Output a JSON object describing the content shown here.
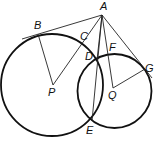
{
  "diagram": {
    "type": "geometry",
    "colors": {
      "stroke": "#111111",
      "background": "#ffffff"
    },
    "points": {
      "A": {
        "label": "A",
        "x": 102,
        "y": 15
      },
      "B": {
        "label": "B",
        "x": 38,
        "y": 34
      },
      "C": {
        "label": "C",
        "x": 87,
        "y": 41
      },
      "D": {
        "label": "D",
        "x": 97,
        "y": 60
      },
      "E": {
        "label": "E",
        "x": 92,
        "y": 121
      },
      "F": {
        "label": "F",
        "x": 108,
        "y": 55
      },
      "G": {
        "label": "G",
        "x": 145,
        "y": 69
      },
      "P": {
        "label": "P",
        "x": 53,
        "y": 85
      },
      "Q": {
        "label": "Q",
        "x": 113,
        "y": 88
      }
    },
    "circles": [
      {
        "name": "circle-P",
        "center": "P",
        "cx": 52,
        "cy": 85,
        "r": 51
      },
      {
        "name": "circle-Q",
        "center": "Q",
        "cx": 114.5,
        "cy": 91,
        "r": 37
      }
    ],
    "segments": [
      [
        "A",
        "B"
      ],
      [
        "A",
        "P"
      ],
      [
        "A",
        "E"
      ],
      [
        "A",
        "D"
      ],
      [
        "A",
        "Q"
      ],
      [
        "A",
        "G"
      ],
      [
        "B",
        "P"
      ],
      [
        "Q",
        "G"
      ]
    ]
  }
}
